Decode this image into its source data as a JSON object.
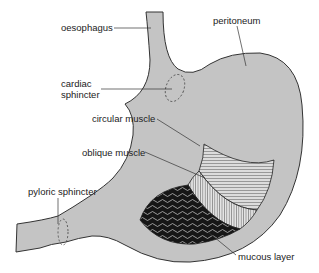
{
  "diagram": {
    "colors": {
      "organ_fill": "#c4c4c4",
      "outline": "#333333",
      "muscle_fill": "#d6d6d6",
      "mucosa_dark": "#111111",
      "background": "#ffffff"
    },
    "labels": [
      {
        "id": "oesophagus",
        "text": "oesophagus"
      },
      {
        "id": "peritoneum",
        "text": "peritoneum"
      },
      {
        "id": "cardiac_sphincter_1",
        "text": "cardiac"
      },
      {
        "id": "cardiac_sphincter_2",
        "text": "sphincter"
      },
      {
        "id": "circular_muscle",
        "text": "circular muscle"
      },
      {
        "id": "oblique_muscle",
        "text": "oblique muscle"
      },
      {
        "id": "pyloric_sphincter",
        "text": "pyloric sphincter"
      },
      {
        "id": "mucous_layer",
        "text": "mucous layer"
      }
    ]
  }
}
